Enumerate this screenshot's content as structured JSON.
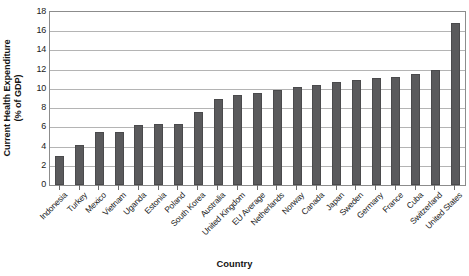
{
  "chart_data": {
    "type": "bar",
    "title": "",
    "xlabel": "Country",
    "ylabel": "Current Health Expenditure\n(% of GDP)",
    "ylabel_line1": "Current Health Expenditure",
    "ylabel_line2": "(% of GDP)",
    "ylim": [
      0,
      18
    ],
    "ytick_step": 2,
    "yticks": [
      "18",
      "16",
      "14",
      "12",
      "10",
      "8",
      "6",
      "4",
      "2",
      "0"
    ],
    "ytick_values": [
      18,
      16,
      14,
      12,
      10,
      8,
      6,
      4,
      2,
      0
    ],
    "grid": true,
    "grid_axis": "y",
    "legend": "none",
    "bar_color": "#5a5a5c",
    "grid_color": "#b4b4b4",
    "axis_color": "#8c8c8c",
    "categories": [
      "Indonesia",
      "Turkey",
      "Mexico",
      "Vietnam",
      "Uganda",
      "Estonia",
      "Poland",
      "South Korea",
      "Australia",
      "United Kingdom",
      "EU Average",
      "Netherlands",
      "Norway",
      "Canada",
      "Japan",
      "Sweden",
      "Germany",
      "France",
      "Cuba",
      "Switzerland",
      "United States"
    ],
    "values": [
      3.0,
      4.2,
      5.5,
      5.5,
      6.2,
      6.4,
      6.4,
      7.6,
      9.0,
      9.4,
      9.6,
      9.9,
      10.2,
      10.4,
      10.7,
      10.9,
      11.1,
      11.2,
      11.5,
      12.0,
      16.9
    ]
  }
}
